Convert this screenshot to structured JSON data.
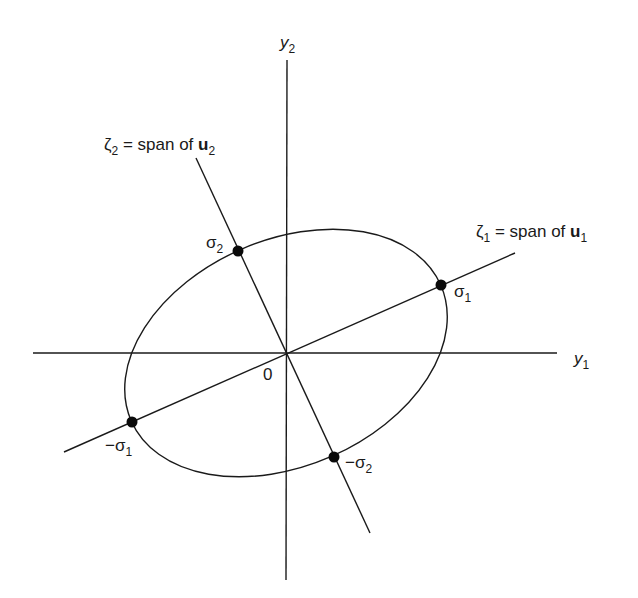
{
  "diagram": {
    "colors": {
      "ink": "#1a1a1a",
      "background": "#ffffff"
    },
    "axes": {
      "horizontal": {
        "symbol": "y",
        "subscript": "1"
      },
      "vertical": {
        "symbol": "y",
        "subscript": "2"
      },
      "origin_label": "0"
    },
    "lines": {
      "zeta1": {
        "symbol": "ζ",
        "subscript": "1",
        "text": " = span of ",
        "vector": "u",
        "vector_subscript": "1"
      },
      "zeta2": {
        "symbol": "ζ",
        "subscript": "2",
        "text": " = span of ",
        "vector": "u",
        "vector_subscript": "2"
      }
    },
    "points": [
      {
        "id": "sigma1",
        "sign": "",
        "symbol": "σ",
        "subscript": "1"
      },
      {
        "id": "neg-sigma1",
        "sign": "−",
        "symbol": "σ",
        "subscript": "1"
      },
      {
        "id": "sigma2",
        "sign": "",
        "symbol": "σ",
        "subscript": "2"
      },
      {
        "id": "neg-sigma2",
        "sign": "−",
        "symbol": "σ",
        "subscript": "2"
      }
    ],
    "ellipse": {
      "center": [
        286,
        353
      ],
      "semi_major": 169,
      "semi_minor": 113,
      "rotation_deg": -23.7
    }
  }
}
